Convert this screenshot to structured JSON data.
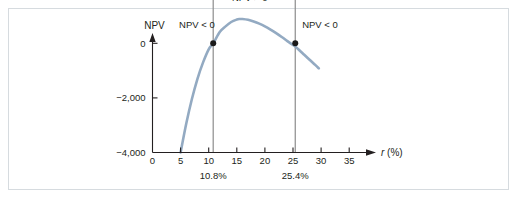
{
  "figure": {
    "background_color": "#ffffff",
    "border_color": "#d6dbdf"
  },
  "chart_data": {
    "type": "line",
    "title": "",
    "subtitle": "",
    "xlabel": "r (%)",
    "xlabel_italic_part": "r",
    "xlabel_rest": " (%)",
    "ylabel": "NPV",
    "xlim": [
      0,
      38
    ],
    "ylim": [
      -4000,
      2600
    ],
    "xticks": [
      0,
      5,
      10,
      15,
      20,
      25,
      30,
      35
    ],
    "xtick_labels": [
      "0",
      "5",
      "10",
      "15",
      "20",
      "25",
      "30",
      "35"
    ],
    "yticks": [
      -4000,
      -2000,
      0,
      2000
    ],
    "ytick_labels": [
      "−4,000",
      "−2,000",
      "0",
      "+2,000"
    ],
    "grid": false,
    "legend_position": "none",
    "series": [
      {
        "name": "NPV curve",
        "color": "#93aac2",
        "line_width": 2.6,
        "x": [
          5.0,
          6.0,
          7.0,
          8.0,
          9.0,
          10.0,
          10.8,
          12.0,
          13.0,
          14.0,
          15.0,
          15.5,
          16.0,
          17.0,
          18.0,
          19.0,
          20.0,
          21.0,
          22.0,
          23.0,
          24.0,
          25.0,
          25.4,
          26.0,
          27.0,
          28.0,
          29.0,
          29.6
        ],
        "y": [
          -4000,
          -2950,
          -2050,
          -1300,
          -700,
          -220,
          0,
          420,
          620,
          780,
          870,
          890,
          890,
          860,
          800,
          720,
          620,
          500,
          370,
          230,
          80,
          -60,
          -120,
          -230,
          -420,
          -610,
          -800,
          -920
        ]
      }
    ],
    "markers": [
      {
        "name": "irr-low",
        "x": 10.8,
        "y": 0,
        "color": "#1a1a1a",
        "radius": 3.0
      },
      {
        "name": "irr-high",
        "x": 25.4,
        "y": 0,
        "color": "#1a1a1a",
        "radius": 3.0
      }
    ],
    "vlines": [
      {
        "name": "irr-low-line",
        "x": 10.8,
        "y_top": 2100,
        "y_bottom": -4000,
        "color": "#8c8c8c",
        "width": 1.2
      },
      {
        "name": "irr-high-line",
        "x": 25.4,
        "y_top": 2100,
        "y_bottom": -4000,
        "color": "#8c8c8c",
        "width": 1.2
      }
    ],
    "annotations": [
      {
        "name": "npv-negative-left",
        "text": "NPV < 0",
        "x": 7.9,
        "y": 560,
        "anchor": "middle"
      },
      {
        "name": "npv-positive-middle",
        "text": "NPV > 0",
        "x": 17.3,
        "y": 1560,
        "anchor": "middle"
      },
      {
        "name": "npv-negative-right",
        "text": "NPV < 0",
        "x": 29.8,
        "y": 560,
        "anchor": "middle"
      }
    ],
    "rate_annotations": [
      {
        "name": "irr-low-rate",
        "text": "10.8%",
        "x": 10.8
      },
      {
        "name": "irr-high-rate",
        "text": "25.4%",
        "x": 25.4
      }
    ],
    "axis_color": "#231f20"
  }
}
